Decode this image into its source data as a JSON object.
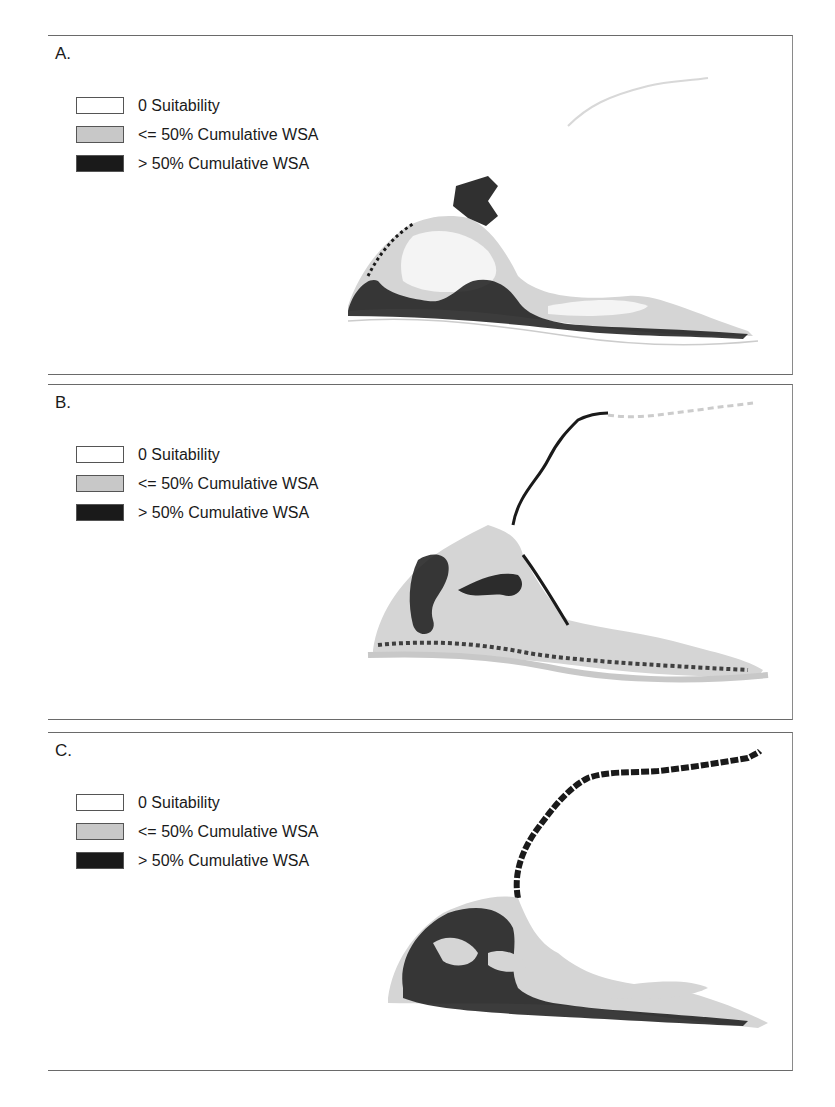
{
  "figure": {
    "legend_colors": {
      "zero": "#ffffff",
      "low": "#c8c8c8",
      "high": "#1a1a1a"
    },
    "panels": [
      {
        "label": "A.",
        "legend": [
          "0 Suitability",
          "<= 50% Cumulative WSA",
          "> 50% Cumulative WSA"
        ]
      },
      {
        "label": "B.",
        "legend": [
          "0 Suitability",
          "<= 50% Cumulative WSA",
          "> 50% Cumulative WSA"
        ]
      },
      {
        "label": "C.",
        "legend": [
          "0 Suitability",
          "<= 50% Cumulative WSA",
          "> 50% Cumulative WSA"
        ]
      }
    ]
  }
}
